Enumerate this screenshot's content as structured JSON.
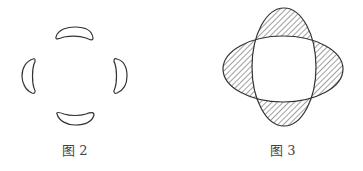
{
  "figures": [
    {
      "id": "fig2",
      "caption": "图 2",
      "description": "Four crescent shapes arranged around a center (top, right, bottom, left)"
    },
    {
      "id": "fig3",
      "caption": "图 3",
      "description": "Two overlapping ellipses (vertical and horizontal) with non-overlapping regions hatched"
    }
  ],
  "colors": {
    "stroke": "#333333",
    "hatch": "#444444",
    "caption": "#444444"
  }
}
